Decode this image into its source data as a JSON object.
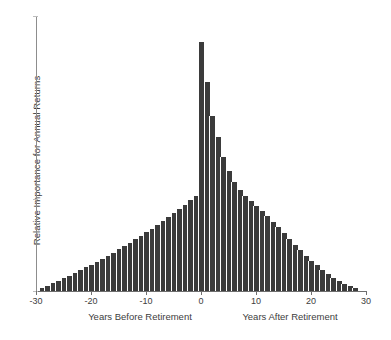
{
  "figure": {
    "background": "#ffffff",
    "bar_color": "#3b3b3b",
    "axis_color": "#6f6f6f"
  },
  "axes": {
    "y_label": "Relative Importance for Annual Returns",
    "x_label_left": "Years Before Retirement",
    "x_label_right": "Years After Retirement",
    "x_ticks": [
      "-30",
      "-20",
      "-10",
      "0",
      "10",
      "20",
      "30"
    ],
    "x_tick_values": [
      -30,
      -20,
      -10,
      0,
      10,
      20,
      30
    ],
    "y_ticks": [],
    "y_tick_labels": []
  },
  "chart_data": {
    "type": "bar",
    "title": "",
    "xlabel": "Years Before Retirement / Years After Retirement",
    "ylabel": "Relative Importance for Annual Returns",
    "xlim": [
      -30,
      30
    ],
    "ylim": [
      0,
      1.0
    ],
    "grid": false,
    "legend": null,
    "bar_color": "#3b3b3b",
    "x_tick_labels": [
      "-30",
      "-20",
      "-10",
      "0",
      "10",
      "20",
      "30"
    ],
    "y_tick_labels": [],
    "note": "Bar width = 1 year. Left side rises approximately linearly from year -29 to year -1; a sharp spike occurs at year 0; the right side decays approximately exponentially to near zero by year 28.",
    "x": [
      -29,
      -28,
      -27,
      -26,
      -25,
      -24,
      -23,
      -22,
      -21,
      -20,
      -19,
      -18,
      -17,
      -16,
      -15,
      -14,
      -13,
      -12,
      -11,
      -10,
      -9,
      -8,
      -7,
      -6,
      -5,
      -4,
      -3,
      -2,
      -1,
      0,
      1,
      2,
      3,
      4,
      5,
      6,
      7,
      8,
      9,
      10,
      11,
      12,
      13,
      14,
      15,
      16,
      17,
      18,
      19,
      20,
      21,
      22,
      23,
      24,
      25,
      26,
      27,
      28
    ],
    "values": [
      0.012,
      0.02,
      0.029,
      0.038,
      0.047,
      0.056,
      0.066,
      0.076,
      0.086,
      0.096,
      0.107,
      0.118,
      0.129,
      0.14,
      0.152,
      0.164,
      0.176,
      0.188,
      0.201,
      0.214,
      0.227,
      0.241,
      0.255,
      0.269,
      0.284,
      0.299,
      0.314,
      0.33,
      0.346,
      0.905,
      0.76,
      0.636,
      0.56,
      0.487,
      0.436,
      0.398,
      0.368,
      0.345,
      0.326,
      0.309,
      0.291,
      0.272,
      0.252,
      0.231,
      0.21,
      0.189,
      0.168,
      0.148,
      0.128,
      0.11,
      0.093,
      0.077,
      0.062,
      0.049,
      0.037,
      0.027,
      0.018,
      0.01
    ]
  }
}
